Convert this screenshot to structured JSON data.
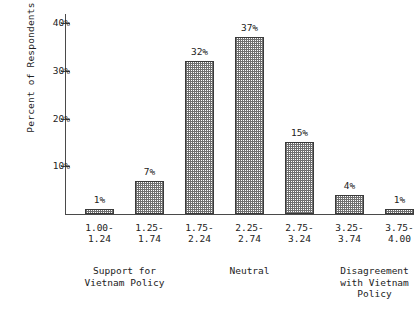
{
  "chart_data": {
    "type": "bar",
    "title": "",
    "subtitle": "",
    "xlabel": "",
    "ylabel": "Percent of Respondents",
    "categories": [
      "1.00-\n1.24",
      "1.25-\n1.74",
      "1.75-\n2.24",
      "2.25-\n2.74",
      "2.75-\n3.24",
      "3.25-\n3.74",
      "3.75-\n4.00"
    ],
    "category_lines": [
      [
        "1.00-",
        "1.24"
      ],
      [
        "1.25-",
        "1.74"
      ],
      [
        "1.75-",
        "2.24"
      ],
      [
        "2.25-",
        "2.74"
      ],
      [
        "2.75-",
        "3.24"
      ],
      [
        "3.25-",
        "3.74"
      ],
      [
        "3.75-",
        "4.00"
      ]
    ],
    "values": [
      1,
      7,
      32,
      37,
      15,
      4,
      1
    ],
    "value_labels": [
      "1%",
      "7%",
      "32%",
      "37%",
      "15%",
      "4%",
      "1%"
    ],
    "ylim": [
      0,
      42
    ],
    "yticks": [
      10,
      20,
      30,
      40
    ],
    "ytick_labels": [
      "10%",
      "20%",
      "30%",
      "40%"
    ],
    "grid": false,
    "legend": "none",
    "bar_fill": "checkerboard-hatch",
    "bar_edge_color": "#3a3a3a",
    "axis_color": "#4a4a4a",
    "background_color": "#ffffff",
    "group_labels": [
      {
        "lines": [
          "Support for",
          "Vietnam Policy"
        ],
        "spans_bars": [
          0,
          1
        ]
      },
      {
        "lines": [
          "Neutral"
        ],
        "spans_bars": [
          2,
          3,
          4
        ]
      },
      {
        "lines": [
          "Disagreement",
          "with Vietnam",
          "Policy"
        ],
        "spans_bars": [
          5,
          6
        ]
      }
    ]
  },
  "geometry": {
    "baseline_y": 214,
    "axis_left_x": 65,
    "axis_right_x": 414,
    "px_per_percent": 4.775,
    "bar_width": 29,
    "bar_left_positions": [
      85,
      135,
      185,
      235,
      285,
      335,
      385
    ]
  }
}
